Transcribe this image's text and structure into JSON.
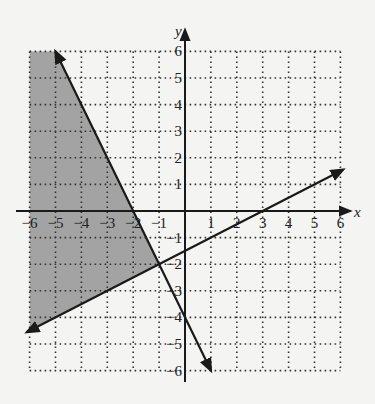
{
  "chart_data": {
    "type": "line",
    "title": "",
    "xlabel": "x",
    "ylabel": "y",
    "xlim": [
      -6,
      6
    ],
    "ylim": [
      -6,
      6
    ],
    "grid": "dotted",
    "x_ticks": [
      -6,
      -5,
      -4,
      -3,
      -2,
      -1,
      1,
      2,
      3,
      4,
      5,
      6
    ],
    "y_ticks": [
      6,
      5,
      4,
      3,
      2,
      1,
      -1,
      -2,
      -3,
      -4,
      -5,
      -6
    ],
    "series": [
      {
        "name": "y = -2x - 4",
        "slope": -2,
        "intercept": -4,
        "x": [
          -5,
          1
        ],
        "y": [
          6,
          -6
        ],
        "style": "solid",
        "arrows": true
      },
      {
        "name": "y = 0.5x - 1.5",
        "slope": 0.5,
        "intercept": -1.5,
        "x": [
          -6.1,
          6.1
        ],
        "y": [
          -4.55,
          1.55
        ],
        "style": "solid",
        "arrows": true
      }
    ],
    "shaded_region": {
      "description": "y <= -2x - 4 and y >= 0.5x - 1.5",
      "vertices": [
        [
          -6,
          6
        ],
        [
          -5,
          6
        ],
        [
          -1,
          -2
        ],
        [
          -6,
          -4.5
        ]
      ],
      "color": "#9a9a9a"
    },
    "intersection": [
      -1,
      -2
    ]
  },
  "colors": {
    "background": "#f4f4f2",
    "shade": "#9a9a9a",
    "line": "#1a1a1a",
    "grid": "#333333"
  }
}
